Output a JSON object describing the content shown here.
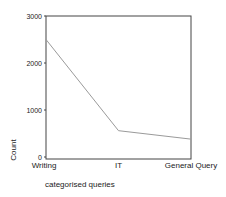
{
  "chart_data": {
    "type": "line",
    "title": "",
    "xlabel": "categorised queries",
    "ylabel": "Count",
    "categories": [
      "Writing",
      "IT",
      "General Query"
    ],
    "series": [
      {
        "name": "Count",
        "values": [
          2500,
          560,
          380
        ]
      }
    ],
    "ylim": [
      0,
      3000
    ],
    "yticks": [
      0,
      1000,
      2000,
      3000
    ],
    "ytick_labels": [
      "0",
      "1000",
      "2000",
      "3000"
    ],
    "grid": false,
    "legend": "none",
    "colors": {
      "line": "#9a9a9a",
      "frame": "#444444",
      "text": "#222222"
    }
  }
}
